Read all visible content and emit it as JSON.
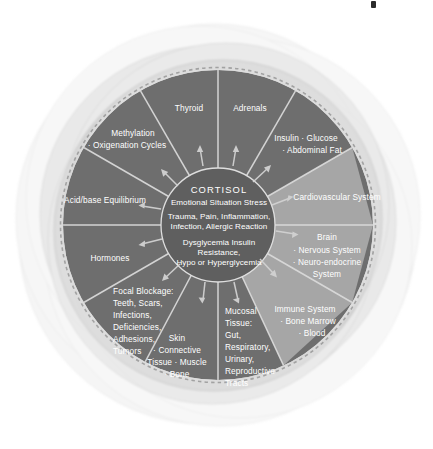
{
  "diagram": {
    "type": "radial-wheel",
    "center": {
      "title": "CORTISOL",
      "lines": [
        "Emotional Situation Stress",
        "Trauma, Pain, Inflammation,",
        "Infection, Allergic Reaction",
        "Dysglycemia Insulin",
        "Resistance,",
        "Hypo or Hyperglycemia"
      ]
    },
    "colors": {
      "segment_dark": "#6e6e6e",
      "segment_light": "#a6a6a6",
      "divider": "#d9d9d9",
      "halo": "#cfcfcf",
      "background": "#ffffff",
      "text": "#ffffff",
      "speck": "#2b2b2b"
    },
    "segments": [
      {
        "id": "thyroid",
        "tone": "dark",
        "lines": [
          "Thyroid"
        ]
      },
      {
        "id": "adrenals",
        "tone": "dark",
        "lines": [
          "Adrenals"
        ]
      },
      {
        "id": "insulin-glucose",
        "tone": "dark",
        "lines": [
          "Insulin · Glucose",
          "· Abdominal Fat"
        ]
      },
      {
        "id": "cardiovascular",
        "tone": "light",
        "lines": [
          "Cardiovascular System"
        ]
      },
      {
        "id": "brain",
        "tone": "light",
        "lines": [
          "Brain",
          "· Nervous System",
          "· Neuro-endocrine",
          "System"
        ]
      },
      {
        "id": "immune",
        "tone": "light",
        "lines": [
          "Immune System",
          "· Bone Marrow",
          "· Blood"
        ]
      },
      {
        "id": "mucosal-tissue",
        "tone": "dark",
        "lines": [
          "Mucosal",
          "Tissue:",
          "Gut,",
          "Respiratory,",
          "Urinary,",
          "Reproductive",
          "Tracts"
        ]
      },
      {
        "id": "skin",
        "tone": "dark",
        "lines": [
          "Skin",
          "· Connective",
          "Tissue · Muscle",
          "· Bone"
        ]
      },
      {
        "id": "focal-blockage",
        "tone": "dark",
        "lines": [
          "Focal Blockage:",
          "Teeth, Scars,",
          "Infections,",
          "Deficiencies,",
          "Adhesions,",
          "Tumors"
        ]
      },
      {
        "id": "hormones",
        "tone": "dark",
        "lines": [
          "Hormones"
        ]
      },
      {
        "id": "acid-base",
        "tone": "dark",
        "lines": [
          "Acid/base Equilibrium"
        ]
      },
      {
        "id": "methylation",
        "tone": "dark",
        "lines": [
          "Methylation",
          "· Oxigenation Cycles"
        ]
      }
    ]
  },
  "text": {
    "thyroid": "Thyroid",
    "adrenals": "Adrenals",
    "insulin_1": "Insulin · Glucose",
    "insulin_2": "· Abdominal Fat",
    "cardiovascular": "Cardiovascular System",
    "brain_1": "Brain",
    "brain_2": "· Nervous System",
    "brain_3": "· Neuro-endocrine",
    "brain_4": "System",
    "immune_1": "Immune System",
    "immune_2": "· Bone Marrow",
    "immune_3": "· Blood",
    "mucosal_1": "Mucosal",
    "mucosal_2": "Tissue:",
    "mucosal_3": "Gut,",
    "mucosal_4": "Respiratory,",
    "mucosal_5": "Urinary,",
    "mucosal_6": "Reproductive",
    "mucosal_7": "Tracts",
    "skin_1": "Skin",
    "skin_2": "· Connective",
    "skin_3": "Tissue · Muscle",
    "skin_4": "· Bone",
    "focal_1": "Focal Blockage:",
    "focal_2": "Teeth, Scars,",
    "focal_3": "Infections,",
    "focal_4": "Deficiencies,",
    "focal_5": "Adhesions,",
    "focal_6": "Tumors",
    "hormones": "Hormones",
    "acid_base": "Acid/base Equilibrium",
    "methylation_1": "Methylation",
    "methylation_2": "· Oxigenation Cycles",
    "core_title": "CORTISOL",
    "core_1": "Emotional Situation Stress",
    "core_2": "Trauma, Pain, Inflammation,",
    "core_3": "Infection, Allergic Reaction",
    "core_4": "Dysglycemia Insulin",
    "core_5": "Resistance,",
    "core_6": "Hypo or Hyperglycemia"
  }
}
